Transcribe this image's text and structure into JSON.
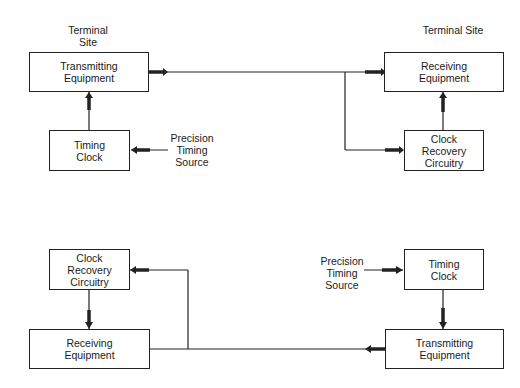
{
  "top_section": {
    "left_site_label": "Terminal Site",
    "right_site_label": "Terminal Site",
    "transmitting_equipment": [
      "Transmitting",
      "Equipment"
    ],
    "timing_clock": [
      "Timing",
      "Clock"
    ],
    "precision_timing_source": [
      "Precision",
      "Timing",
      "Source"
    ],
    "receiving_equipment": [
      "Receiving",
      "Equipment"
    ],
    "clock_recovery_circuitry": [
      "Clock",
      "Recovery",
      "Circuitry"
    ]
  },
  "bottom_section": {
    "clock_recovery_circuitry": [
      "Clock",
      "Recovery",
      "Circuitry"
    ],
    "receiving_equipment": [
      "Receiving",
      "Equipment"
    ],
    "precision_timing_source": [
      "Precision",
      "Timing",
      "Source"
    ],
    "timing_clock": [
      "Timing",
      "Clock"
    ],
    "transmitting_equipment": [
      "Transmitting",
      "Equipment"
    ]
  },
  "colors": {
    "line": "#222222",
    "background": "#ffffff"
  }
}
